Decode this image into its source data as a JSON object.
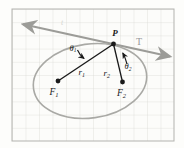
{
  "figure": {
    "type": "ellipse-reflection-diagram",
    "labels": {
      "point_p": "P",
      "tangent": "T",
      "tangent_faint": "t",
      "theta1": {
        "base": "θ",
        "sub": "1"
      },
      "theta2": {
        "base": "θ",
        "sub": "2"
      },
      "r1": {
        "base": "r",
        "sub": "1"
      },
      "r2": {
        "base": "r",
        "sub": "2"
      },
      "f1": {
        "base": "F",
        "sub": "1"
      },
      "f2": {
        "base": "F",
        "sub": "2"
      }
    },
    "colors": {
      "background": "#fdfdfb",
      "grid_line": "#dcdcd8",
      "grid_border": "#b3b3af",
      "ellipse_curve": "#a9a9a5",
      "tangent_line": "#9c9c98",
      "ink": "#1a1a1a",
      "faint_mark": "#d6d6d2"
    }
  }
}
